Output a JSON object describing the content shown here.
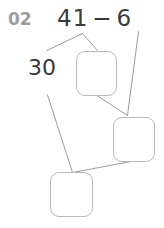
{
  "problem": {
    "number_label": "02",
    "equation": {
      "left_operand": "41",
      "operator": "−",
      "right_operand": "6",
      "full_text": "41 − 6"
    },
    "decomposition_number": "30",
    "answer_boxes": [
      {
        "id": "answer-box-1",
        "value": "",
        "placeholder": ""
      },
      {
        "id": "answer-box-2",
        "value": "",
        "placeholder": ""
      },
      {
        "id": "answer-box-3",
        "value": "",
        "placeholder": ""
      }
    ]
  },
  "colors": {
    "background": "#ffffff",
    "problem_number": "#9d9d9d",
    "text": "#3a3a3a",
    "box_border": "#b9b9b9",
    "connector_line": "#8e8e8e"
  },
  "connectors": [
    {
      "name": "split-left-branch",
      "from": "equation-left-operand",
      "to": "decomposition-number"
    },
    {
      "name": "split-right-branch",
      "from": "equation-left-operand",
      "to": "answer-box-1"
    },
    {
      "name": "minuend-to-box2",
      "from": "equation-right-operand",
      "to": "answer-box-2"
    },
    {
      "name": "box1-to-box2",
      "from": "answer-box-1",
      "to": "answer-box-2"
    },
    {
      "name": "decomp-to-box3",
      "from": "decomposition-number",
      "to": "answer-box-3"
    },
    {
      "name": "box2-to-box3",
      "from": "answer-box-2",
      "to": "answer-box-3"
    }
  ]
}
